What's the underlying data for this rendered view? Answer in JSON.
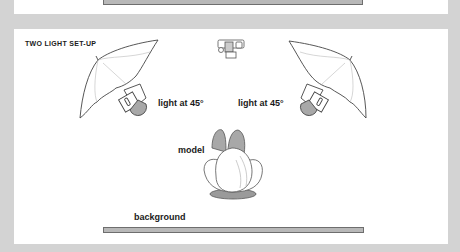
{
  "diagram": {
    "title": "TWO LIGHT SET-UP",
    "labels": {
      "light_left": "light at 45°",
      "light_right": "light at 45°",
      "model": "model",
      "background": "background"
    },
    "elements": [
      "camera",
      "umbrella-light-left",
      "umbrella-light-right",
      "model",
      "background"
    ],
    "colors": {
      "page_bg": "#d3d3d3",
      "panel": "#ffffff",
      "bar_fill": "#b8b8b8",
      "shade": "#a8a8a8"
    }
  }
}
